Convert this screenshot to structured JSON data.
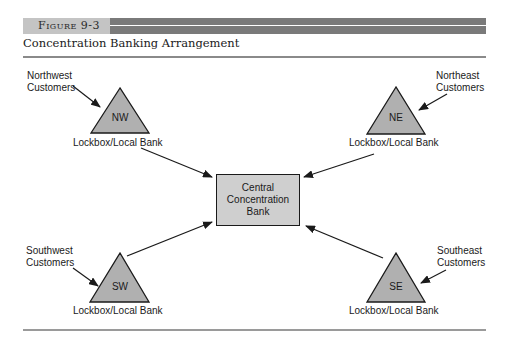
{
  "figure": {
    "label": "Figure 9-3",
    "title": "Concentration Banking Arrangement"
  },
  "colors": {
    "header_bar": "#7a7a7a",
    "label_box": "#c4c4c4",
    "node_fill": "#b0b0b0",
    "center_fill": "#cfcfcf",
    "line": "#1a1a1a"
  },
  "nodes": {
    "nw": {
      "abbr": "NW",
      "customers_line1": "Northwest",
      "customers_line2": "Customers",
      "bank_label": "Lockbox/Local Bank"
    },
    "ne": {
      "abbr": "NE",
      "customers_line1": "Northeast",
      "customers_line2": "Customers",
      "bank_label": "Lockbox/Local Bank"
    },
    "sw": {
      "abbr": "SW",
      "customers_line1": "Southwest",
      "customers_line2": "Customers",
      "bank_label": "Lockbox/Local Bank"
    },
    "se": {
      "abbr": "SE",
      "customers_line1": "Southeast",
      "customers_line2": "Customers",
      "bank_label": "Lockbox/Local Bank"
    }
  },
  "center": {
    "line1": "Central",
    "line2": "Concentration",
    "line3": "Bank"
  }
}
